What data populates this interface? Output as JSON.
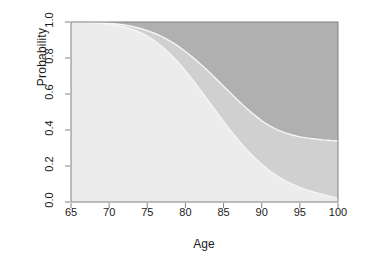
{
  "chart_data": {
    "type": "area",
    "title": "",
    "xlabel": "Age",
    "ylabel": "Probability",
    "xlim": [
      65,
      100
    ],
    "ylim": [
      0,
      1
    ],
    "xticks": [
      65,
      70,
      75,
      80,
      85,
      90,
      95,
      100
    ],
    "xtick_labels": [
      "65",
      "70",
      "75",
      "80",
      "85",
      "90",
      "95",
      "100"
    ],
    "yticks": [
      0.0,
      0.2,
      0.4,
      0.6,
      0.8,
      1.0
    ],
    "ytick_labels": [
      "0.0",
      "0.2",
      "0.4",
      "0.6",
      "0.8",
      "1.0"
    ],
    "grid": false,
    "legend": "none",
    "stacked": true,
    "x": [
      65,
      66,
      67,
      68,
      69,
      70,
      71,
      72,
      73,
      74,
      75,
      76,
      77,
      78,
      79,
      80,
      81,
      82,
      83,
      84,
      85,
      86,
      87,
      88,
      89,
      90,
      91,
      92,
      93,
      94,
      95,
      96,
      97,
      98,
      99,
      100
    ],
    "series": [
      {
        "name": "lower-boundary",
        "description": "lower cumulative curve: upper edge of the light band",
        "color": "#ececec",
        "values": [
          1.0,
          0.999,
          0.998,
          0.996,
          0.993,
          0.989,
          0.982,
          0.973,
          0.96,
          0.943,
          0.921,
          0.894,
          0.861,
          0.822,
          0.778,
          0.729,
          0.676,
          0.62,
          0.562,
          0.504,
          0.447,
          0.392,
          0.34,
          0.292,
          0.248,
          0.209,
          0.175,
          0.145,
          0.12,
          0.099,
          0.081,
          0.066,
          0.053,
          0.042,
          0.031,
          0.02
        ]
      },
      {
        "name": "upper-boundary",
        "description": "upper cumulative curve: upper edge of the medium band",
        "color": "#d0d0d0",
        "values": [
          1.0,
          1.0,
          0.999,
          0.998,
          0.996,
          0.993,
          0.989,
          0.983,
          0.975,
          0.965,
          0.952,
          0.936,
          0.917,
          0.894,
          0.867,
          0.836,
          0.802,
          0.765,
          0.726,
          0.685,
          0.643,
          0.601,
          0.56,
          0.521,
          0.484,
          0.451,
          0.424,
          0.402,
          0.385,
          0.372,
          0.362,
          0.355,
          0.35,
          0.345,
          0.342,
          0.34
        ]
      },
      {
        "name": "top-region",
        "description": "dark band filling from the upper curve to probability 1.0",
        "color": "#b0b0b0",
        "values": [
          0.0,
          0.0,
          0.001,
          0.002,
          0.004,
          0.007,
          0.011,
          0.017,
          0.025,
          0.035,
          0.048,
          0.064,
          0.083,
          0.106,
          0.133,
          0.164,
          0.198,
          0.235,
          0.274,
          0.315,
          0.357,
          0.399,
          0.44,
          0.479,
          0.516,
          0.549,
          0.576,
          0.598,
          0.615,
          0.628,
          0.638,
          0.645,
          0.65,
          0.655,
          0.658,
          0.66
        ]
      }
    ]
  },
  "figure": {
    "background": "#ffffff",
    "axis_color": "#808080",
    "text_color": "#1a1a1a",
    "boundary_line_color": "#f5f5f5"
  }
}
